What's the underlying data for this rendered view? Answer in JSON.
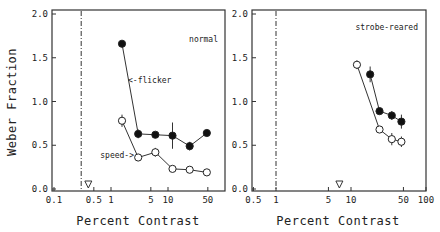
{
  "chart_data": [
    {
      "type": "line",
      "panel_label": "normal",
      "xlabel": "Percent Contrast",
      "ylabel": "Weber Fraction",
      "xscale": "log",
      "xlim": [
        0.1,
        80
      ],
      "ylim": [
        0.0,
        2.0
      ],
      "xticks": [
        0.1,
        0.5,
        1,
        5,
        10,
        50
      ],
      "xtick_labels": [
        "0.1",
        "0.5",
        "1",
        "5",
        "10",
        "50"
      ],
      "yticks": [
        0.0,
        0.5,
        1.0,
        1.5,
        2.0
      ],
      "ytick_labels": [
        "0.0",
        "0.5",
        "1.0",
        "1.5",
        "2.0"
      ],
      "dashed_vline_x": 0.3,
      "threshold_marker_x": 0.4,
      "series": [
        {
          "name": "flicker",
          "marker": "filled-circle",
          "annotation": "<-flicker",
          "x": [
            1.56,
            3,
            6,
            12,
            24,
            48
          ],
          "values": [
            1.66,
            0.63,
            0.62,
            0.61,
            0.49,
            0.64
          ],
          "errors": [
            0.0,
            0.05,
            0.03,
            0.15,
            0.05,
            0.03
          ]
        },
        {
          "name": "speed",
          "marker": "open-circle",
          "annotation": "speed->",
          "x": [
            1.56,
            3,
            6,
            12,
            24,
            48
          ],
          "values": [
            0.78,
            0.36,
            0.42,
            0.23,
            0.22,
            0.19
          ],
          "errors": [
            0.07,
            0.04,
            0.05,
            0.02,
            0.02,
            0.02
          ]
        }
      ]
    },
    {
      "type": "line",
      "panel_label": "strobe-reared",
      "xlabel": "Percent Contrast",
      "ylabel": "",
      "xscale": "log",
      "xlim": [
        0.5,
        100
      ],
      "ylim": [
        0.0,
        2.0
      ],
      "xticks": [
        0.5,
        1,
        5,
        10,
        50,
        100
      ],
      "xtick_labels": [
        "0.5",
        "1",
        "5",
        "10",
        "50",
        "100"
      ],
      "yticks": [
        0.0,
        0.5,
        1.0,
        1.5,
        2.0
      ],
      "ytick_labels": [
        "0.0",
        "0.5",
        "1.0",
        "1.5",
        "2.0"
      ],
      "dashed_vline_x": 1,
      "threshold_marker_x": 7,
      "series": [
        {
          "name": "flicker",
          "marker": "filled-circle",
          "x": [
            18,
            24,
            35,
            47
          ],
          "values": [
            1.31,
            0.89,
            0.84,
            0.77
          ],
          "errors": [
            0.09,
            0.03,
            0.05,
            0.08
          ]
        },
        {
          "name": "speed",
          "marker": "open-circle",
          "x": [
            12,
            24,
            35,
            47
          ],
          "values": [
            1.42,
            0.68,
            0.57,
            0.54
          ],
          "errors": [
            0.05,
            0.02,
            0.07,
            0.06
          ]
        }
      ]
    }
  ]
}
